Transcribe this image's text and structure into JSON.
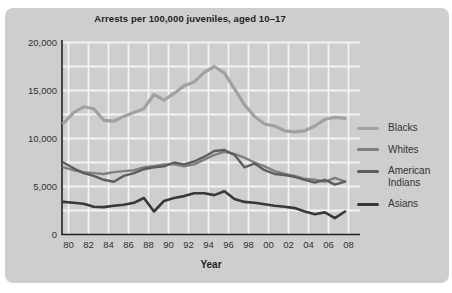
{
  "figure": {
    "title": "Arrests per 100,000 juveniles, aged 10–17",
    "xlabel": "Year"
  },
  "colors": {
    "panel_background": "#cecece",
    "gridline": "#f3f3f3",
    "axis": "#222222",
    "tick_text": "#333333",
    "title_text": "#1e1e1e"
  },
  "legend": [
    {
      "label": "Blacks",
      "color": "#a1a1a1"
    },
    {
      "label": "Whites",
      "color": "#7f7f7f"
    },
    {
      "label": "American Indians",
      "color": "#5d5d5d"
    },
    {
      "label": "Asians",
      "color": "#383838"
    }
  ],
  "chart_data": {
    "type": "line",
    "title": "Arrests per 100,000 juveniles, aged 10–17",
    "xlabel": "Year",
    "ylabel": "",
    "x": [
      1980,
      1981,
      1982,
      1983,
      1984,
      1985,
      1986,
      1987,
      1988,
      1989,
      1990,
      1991,
      1992,
      1993,
      1994,
      1995,
      1996,
      1997,
      1998,
      1999,
      2000,
      2001,
      2002,
      2003,
      2004,
      2005,
      2006,
      2007,
      2008
    ],
    "x_tick_labels": [
      "80",
      "82",
      "84",
      "86",
      "88",
      "90",
      "92",
      "94",
      "96",
      "98",
      "00",
      "02",
      "04",
      "06",
      "08"
    ],
    "ylim": [
      0,
      20000
    ],
    "y_ticks": [
      0,
      5000,
      10000,
      15000,
      20000
    ],
    "y_tick_labels": [
      "0",
      "5,000",
      "10,000",
      "15,000",
      "20,000"
    ],
    "grid": {
      "shown": true,
      "color": "white",
      "x_interval_years": 2,
      "y_interval": 2500
    },
    "legend_position": "right",
    "series": [
      {
        "name": "Blacks",
        "color": "#a1a1a1",
        "width": 3.2,
        "values": [
          11600,
          12700,
          13300,
          13100,
          11900,
          11800,
          12300,
          12700,
          13100,
          14600,
          14000,
          14700,
          15500,
          15900,
          16900,
          17500,
          16800,
          15200,
          13500,
          12300,
          11500,
          11300,
          10800,
          10700,
          10800,
          11300,
          12000,
          12200,
          12100
        ]
      },
      {
        "name": "Whites",
        "color": "#7f7f7f",
        "width": 2.4,
        "values": [
          7000,
          6700,
          6500,
          6400,
          6300,
          6500,
          6600,
          6700,
          7000,
          7100,
          7300,
          7300,
          7100,
          7300,
          7800,
          8300,
          8600,
          8400,
          8000,
          7500,
          7100,
          6600,
          6300,
          6100,
          5800,
          5700,
          5500,
          5900,
          5500
        ]
      },
      {
        "name": "American Indians",
        "color": "#5d5d5d",
        "width": 2.4,
        "values": [
          7500,
          6900,
          6400,
          6100,
          5700,
          5500,
          6100,
          6400,
          6800,
          7000,
          7100,
          7500,
          7300,
          7600,
          8100,
          8700,
          8800,
          8300,
          7000,
          7400,
          6700,
          6300,
          6200,
          6000,
          5700,
          5400,
          5700,
          5200,
          5500
        ]
      },
      {
        "name": "Asians",
        "color": "#383838",
        "width": 2.6,
        "values": [
          3400,
          3300,
          3200,
          2900,
          2850,
          3000,
          3100,
          3300,
          3800,
          2400,
          3500,
          3800,
          4000,
          4300,
          4300,
          4100,
          4500,
          3700,
          3400,
          3300,
          3150,
          3000,
          2900,
          2750,
          2400,
          2100,
          2300,
          1700,
          2400
        ]
      }
    ]
  }
}
